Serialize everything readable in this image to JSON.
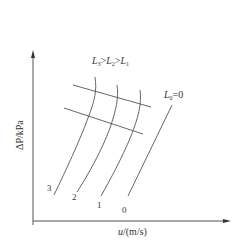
{
  "diagram": {
    "type": "characteristic-curves",
    "title_relation": {
      "parts": [
        {
          "sym": "L",
          "sub": "3"
        },
        {
          "sym": ">",
          "sub": ""
        },
        {
          "sym": "L",
          "sub": "2"
        },
        {
          "sym": ">",
          "sub": ""
        },
        {
          "sym": "L",
          "sub": "1"
        }
      ],
      "text": "L3>L2>L1"
    },
    "zero_line_label": {
      "sym": "L",
      "sub": "0",
      "rest": "=0",
      "text": "L0=0"
    },
    "y_axis_label": "ΔP/kPa",
    "x_axis_label": {
      "var": "u",
      "unit": "/(m/s)",
      "text": "u/(m/s)"
    },
    "curve_labels": [
      "3",
      "2",
      "1",
      "0"
    ],
    "line_color": "#444444"
  }
}
